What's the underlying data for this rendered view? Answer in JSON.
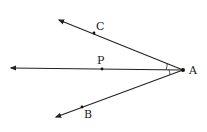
{
  "diagram": {
    "type": "geometry-angle-bisector",
    "vertex": {
      "label": "A",
      "x": 183,
      "y": 70,
      "label_x": 189,
      "label_y": 74
    },
    "rays": [
      {
        "name": "AC",
        "end": {
          "x": 59,
          "y": 20
        },
        "point": {
          "label": "C",
          "x": 94,
          "y": 33,
          "label_x": 96,
          "label_y": 30
        }
      },
      {
        "name": "AP",
        "end": {
          "x": 11,
          "y": 68
        },
        "point": {
          "label": "P",
          "x": 102,
          "y": 69,
          "label_x": 97,
          "label_y": 64
        }
      },
      {
        "name": "AB",
        "end": {
          "x": 56,
          "y": 117
        },
        "point": {
          "label": "B",
          "x": 82,
          "y": 107,
          "label_x": 84,
          "label_y": 118
        }
      }
    ],
    "angle_marks": [
      "CAP",
      "PAB"
    ],
    "colors": {
      "line": "#222222",
      "label": "#1a1a1a",
      "background": "#ffffff"
    }
  }
}
